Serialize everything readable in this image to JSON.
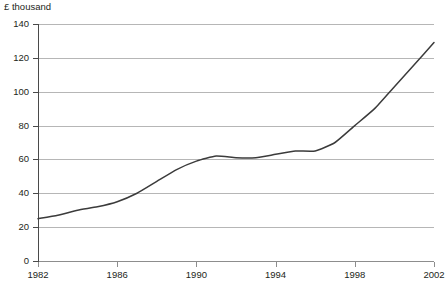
{
  "chart_data": {
    "type": "line",
    "title": "",
    "subtitle": "",
    "unit_label": "£ thousand",
    "xlabel": "",
    "ylabel": "£ thousand",
    "xlim": [
      1982,
      2002
    ],
    "ylim": [
      0,
      140
    ],
    "grid": true,
    "legend": "none",
    "y_ticks": [
      140,
      120,
      100,
      80,
      60,
      40,
      20,
      0
    ],
    "x_ticks": [
      1982,
      1986,
      1990,
      1994,
      1998,
      2002
    ],
    "series": [
      {
        "name": "Average value",
        "color": "#3b3b3b",
        "x": [
          1982,
          1983,
          1984,
          1985,
          1986,
          1987,
          1988,
          1989,
          1990,
          1991,
          1992,
          1993,
          1994,
          1995,
          1996,
          1997,
          1998,
          1999,
          2000,
          2001,
          2002
        ],
        "values": [
          25,
          27,
          30,
          32,
          35,
          40,
          47,
          54,
          59,
          62,
          61,
          61,
          63,
          65,
          65,
          70,
          80,
          90,
          103,
          116,
          129
        ]
      }
    ],
    "annotations": []
  },
  "axis": {
    "unit_label": "£ thousand",
    "y_tick_labels": [
      "140",
      "120",
      "100",
      "80",
      "60",
      "40",
      "20",
      "0"
    ],
    "x_tick_labels": [
      "1982",
      "1986",
      "1990",
      "1994",
      "1998",
      "2002"
    ]
  },
  "colors": {
    "line": "#3b3b3b",
    "grid": "#b6b6b6",
    "axis": "#4a4a4a",
    "text": "#231f20",
    "background": "#ffffff"
  }
}
